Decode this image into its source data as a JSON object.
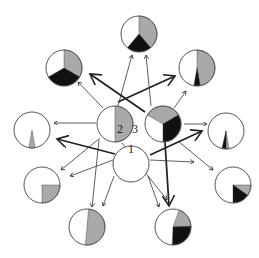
{
  "colors": {
    "outline": "#555555",
    "gray": "#a9a9a9",
    "black": "#111111",
    "white": "#ffffff",
    "arrow": "#333333"
  },
  "labels": [
    {
      "id": "label-1",
      "text": "1",
      "x": 128,
      "y": 153
    },
    {
      "id": "label-2",
      "text": "2",
      "x": 117,
      "y": 133
    },
    {
      "id": "label-3",
      "text": "3",
      "x": 132,
      "y": 133
    }
  ],
  "nodes": [
    {
      "id": "node-1",
      "cx": 131,
      "cy": 164,
      "r": 18,
      "slices": []
    },
    {
      "id": "node-2",
      "cx": 115,
      "cy": 124,
      "r": 18,
      "slices": [
        {
          "fill": "gray",
          "start": 0,
          "end": 180
        }
      ]
    },
    {
      "id": "node-3",
      "cx": 163,
      "cy": 124,
      "r": 18,
      "slices": [
        {
          "fill": "gray",
          "start": 300,
          "end": 60
        },
        {
          "fill": "black",
          "start": 60,
          "end": 180
        }
      ]
    },
    {
      "id": "top",
      "cx": 139,
      "cy": 34,
      "r": 18,
      "slices": [
        {
          "fill": "gray",
          "start": 0,
          "end": 140
        },
        {
          "fill": "black",
          "start": 140,
          "end": 220
        }
      ]
    },
    {
      "id": "upper-left",
      "cx": 64,
      "cy": 68,
      "r": 18,
      "slices": [
        {
          "fill": "gray",
          "start": 0,
          "end": 120
        },
        {
          "fill": "black",
          "start": 120,
          "end": 240
        }
      ]
    },
    {
      "id": "upper-right",
      "cx": 197,
      "cy": 68,
      "r": 18,
      "slices": [
        {
          "fill": "gray",
          "start": 0,
          "end": 170
        },
        {
          "fill": "black",
          "start": 170,
          "end": 190
        }
      ]
    },
    {
      "id": "left",
      "cx": 32,
      "cy": 130,
      "r": 18,
      "slices": [
        {
          "fill": "gray",
          "start": 170,
          "end": 190
        }
      ]
    },
    {
      "id": "right",
      "cx": 226,
      "cy": 131,
      "r": 18,
      "slices": [
        {
          "fill": "gray",
          "start": 170,
          "end": 180
        },
        {
          "fill": "black",
          "start": 180,
          "end": 193
        }
      ]
    },
    {
      "id": "lower-left",
      "cx": 42,
      "cy": 185,
      "r": 18,
      "slices": [
        {
          "fill": "gray",
          "start": 90,
          "end": 180
        }
      ]
    },
    {
      "id": "lower-right",
      "cx": 233,
      "cy": 185,
      "r": 18,
      "slices": [
        {
          "fill": "gray",
          "start": 90,
          "end": 125
        },
        {
          "fill": "black",
          "start": 125,
          "end": 180
        }
      ]
    },
    {
      "id": "bottom-left",
      "cx": 87,
      "cy": 227,
      "r": 18,
      "slices": [
        {
          "fill": "gray",
          "start": 5,
          "end": 185
        }
      ]
    },
    {
      "id": "bottom-right",
      "cx": 173,
      "cy": 227,
      "r": 18,
      "slices": [
        {
          "fill": "gray",
          "start": 20,
          "end": 88
        },
        {
          "fill": "black",
          "start": 88,
          "end": 182
        }
      ]
    }
  ],
  "edges": [
    {
      "from": "node-2",
      "to": "upper-left",
      "x1": 103,
      "y1": 108,
      "x2": 78,
      "y2": 82,
      "bold": false
    },
    {
      "from": "node-2",
      "to": "top",
      "x1": 118,
      "y1": 106,
      "x2": 132,
      "y2": 55,
      "bold": false
    },
    {
      "from": "node-2",
      "to": "upper-right",
      "x1": 118,
      "y1": 102,
      "x2": 175,
      "y2": 76,
      "bold": true
    },
    {
      "from": "node-2",
      "to": "left",
      "x1": 96,
      "y1": 123,
      "x2": 54,
      "y2": 123,
      "bold": false
    },
    {
      "from": "node-2",
      "to": "lower-left",
      "x1": 100,
      "y1": 138,
      "x2": 61,
      "y2": 170,
      "bold": false
    },
    {
      "from": "node-2",
      "to": "bottom-left",
      "x1": 99,
      "y1": 140,
      "x2": 92,
      "y2": 207,
      "bold": false
    },
    {
      "from": "node-2",
      "to": "bottom-right",
      "x1": 122,
      "y1": 143,
      "x2": 167,
      "y2": 200,
      "bold": false
    },
    {
      "from": "node-3",
      "to": "top",
      "x1": 151,
      "y1": 106,
      "x2": 146,
      "y2": 55,
      "bold": false
    },
    {
      "from": "node-3",
      "to": "upper-left",
      "x1": 145,
      "y1": 112,
      "x2": 90,
      "y2": 74,
      "bold": true
    },
    {
      "from": "node-3",
      "to": "upper-right",
      "x1": 174,
      "y1": 108,
      "x2": 186,
      "y2": 91,
      "bold": false
    },
    {
      "from": "node-3",
      "to": "right",
      "x1": 184,
      "y1": 124,
      "x2": 207,
      "y2": 124,
      "bold": false
    },
    {
      "from": "node-3",
      "to": "lower-right",
      "x1": 178,
      "y1": 141,
      "x2": 213,
      "y2": 170,
      "bold": false
    },
    {
      "from": "node-3",
      "to": "bottom-right",
      "x1": 165,
      "y1": 142,
      "x2": 169,
      "y2": 206,
      "bold": true
    },
    {
      "from": "node-1",
      "to": "left-side",
      "x1": 113,
      "y1": 160,
      "x2": 70,
      "y2": 176,
      "bold": false
    },
    {
      "from": "node-1",
      "to": "bottom-left",
      "x1": 114,
      "y1": 176,
      "x2": 103,
      "y2": 206,
      "bold": false
    },
    {
      "from": "node-1",
      "to": "bottom-right",
      "x1": 148,
      "y1": 176,
      "x2": 159,
      "y2": 207,
      "bold": false
    },
    {
      "from": "node-1",
      "to": "lower-right",
      "x1": 150,
      "y1": 160,
      "x2": 194,
      "y2": 162,
      "bold": false
    },
    {
      "from": "node-1",
      "to": "upper-right-bold",
      "x1": 150,
      "y1": 155,
      "x2": 202,
      "y2": 131,
      "bold": true
    },
    {
      "from": "node-1",
      "to": "upper-left-bold",
      "x1": 115,
      "y1": 154,
      "x2": 57,
      "y2": 139,
      "bold": true
    }
  ]
}
